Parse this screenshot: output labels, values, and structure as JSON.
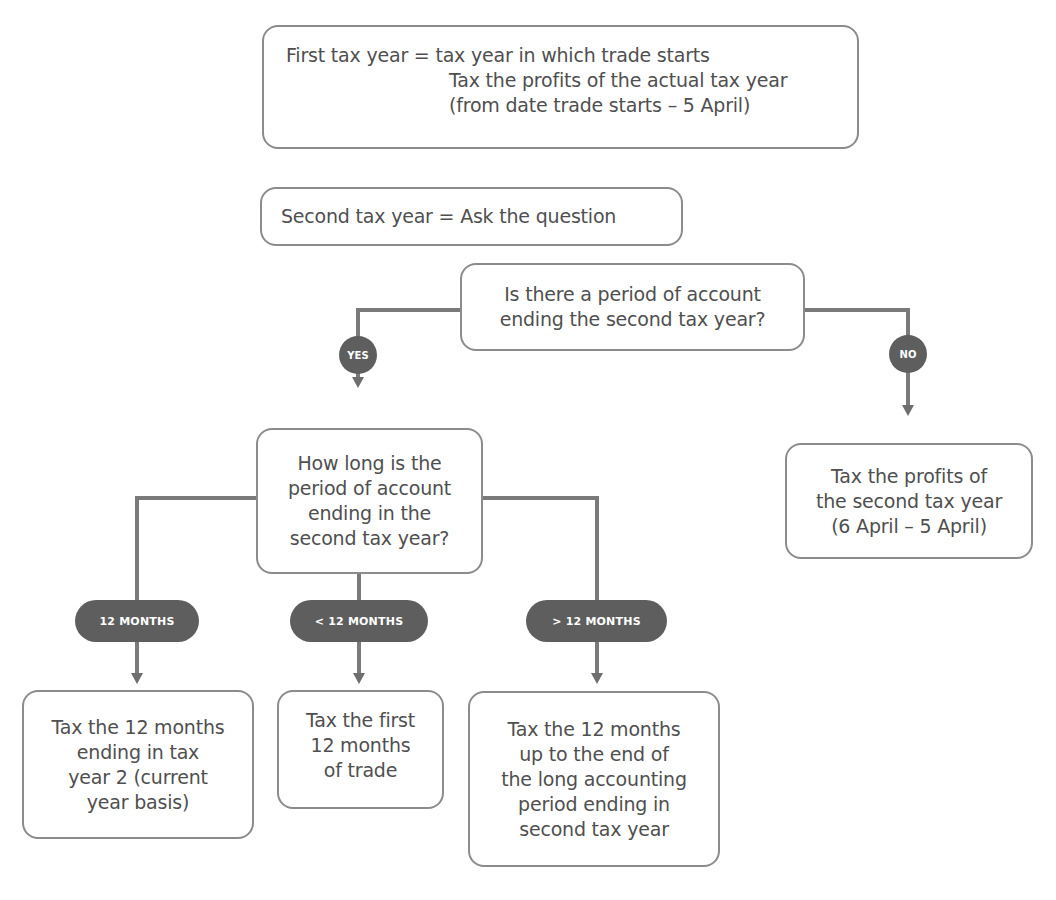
{
  "diagram": {
    "partial_heading": "Trade commencement – opening years",
    "first_tax_year": {
      "line1": "First tax year = tax year in which trade starts",
      "line2": "Tax the profits of the actual tax year",
      "line3": "(from date trade starts – 5 April)"
    },
    "second_tax_year": {
      "label": "Second tax year = Ask the question"
    },
    "question_1": {
      "line1": "Is there a period of account",
      "line2": "ending the second tax year?"
    },
    "branch_yes": "YES",
    "branch_no": "NO",
    "no_result": {
      "line1": "Tax the profits of",
      "line2": "the second tax year",
      "line3": "(6 April – 5 April)"
    },
    "question_2": {
      "line1": "How long is the",
      "line2": "period of account",
      "line3": "ending in the",
      "line4": "second tax year?"
    },
    "branches": [
      {
        "label": "12 MONTHS"
      },
      {
        "label": "< 12 MONTHS"
      },
      {
        "label": "> 12 MONTHS"
      }
    ],
    "results": [
      {
        "lines": [
          "Tax the 12 months",
          "ending in tax",
          "year 2 (current",
          "year basis)"
        ]
      },
      {
        "lines": [
          "Tax the first",
          "12 months",
          "of trade"
        ]
      },
      {
        "lines": [
          "Tax the 12 months",
          "up to the end of",
          "the long accounting",
          "period ending in",
          "second tax year"
        ]
      }
    ],
    "colors": {
      "connector": "#7a7a7a",
      "badge_fill": "#5e5e5e",
      "box_border": "#8c8c8c",
      "text": "#4f4f4f"
    }
  }
}
